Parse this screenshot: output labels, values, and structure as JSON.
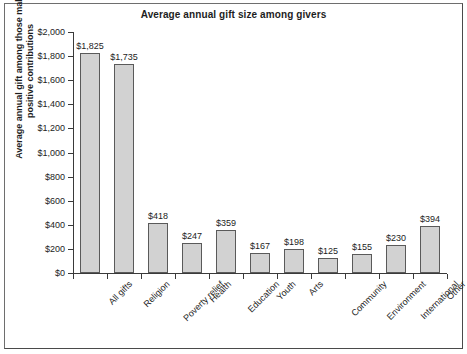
{
  "chart_data": {
    "type": "bar",
    "title": "Average annual gift size among givers",
    "xlabel": "",
    "ylabel": "Average annual gift among those making positive contributions",
    "ylabel_lines": [
      "Average annual gift among those making",
      "positive contributions"
    ],
    "categories": [
      "All gifts",
      "Religion",
      "Poverty relief",
      "Health",
      "Education",
      "Youth",
      "Arts",
      "Community",
      "Environment",
      "International",
      "Other"
    ],
    "values": [
      1825,
      1735,
      418,
      247,
      359,
      167,
      198,
      125,
      155,
      230,
      394
    ],
    "value_labels": [
      "$1,825",
      "$1,735",
      "$418",
      "$247",
      "$359",
      "$167",
      "$198",
      "$125",
      "$155",
      "$230",
      "$394"
    ],
    "ylim": [
      0,
      2000
    ],
    "ytick_values": [
      0,
      200,
      400,
      600,
      800,
      1000,
      1200,
      1400,
      1600,
      1800,
      2000
    ],
    "ytick_labels": [
      "$0",
      "$200",
      "$400",
      "$600",
      "$800",
      "$1,000",
      "$1,200",
      "$1,400",
      "$1,600",
      "$1,800",
      "$2,000"
    ],
    "grid": false,
    "legend": null,
    "legend_position": "none",
    "bar_fill_color": "#d2d2d2",
    "bar_border_color": "#5a5a5a",
    "axis_color": "#3a3a3a",
    "text_color": "#1d1d1d",
    "background_color": "#ffffff"
  }
}
